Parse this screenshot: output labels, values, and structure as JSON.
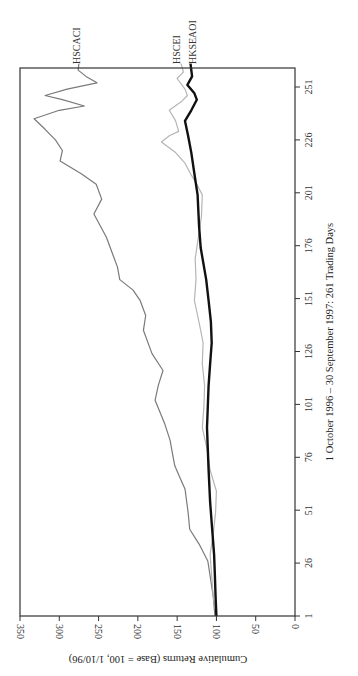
{
  "chart_data": {
    "type": "line",
    "orientation": "rotated-90-clockwise",
    "title": "",
    "xlabel": "1 October 1996 – 30 September 1997: 261 Trading Days",
    "ylabel": "Cumulative Returns (Base = 100, 1/10/96)",
    "x_ticks": [
      1,
      26,
      51,
      76,
      101,
      126,
      151,
      176,
      201,
      226,
      251
    ],
    "y_ticks": [
      0,
      50,
      100,
      150,
      200,
      250,
      300,
      350
    ],
    "xlim": [
      1,
      262
    ],
    "ylim": [
      0,
      350
    ],
    "grid": false,
    "legend": "direct labels at series ends",
    "series": [
      {
        "name": "HSCACI",
        "color": "#7a7a7a",
        "width": 1.2,
        "points": [
          [
            1,
            102
          ],
          [
            10,
            104
          ],
          [
            20,
            108
          ],
          [
            27,
            111
          ],
          [
            35,
            122
          ],
          [
            42,
            134
          ],
          [
            50,
            136
          ],
          [
            61,
            140
          ],
          [
            66,
            146
          ],
          [
            72,
            153
          ],
          [
            78,
            156
          ],
          [
            84,
            159
          ],
          [
            92,
            166
          ],
          [
            103,
            178
          ],
          [
            110,
            174
          ],
          [
            117,
            168
          ],
          [
            125,
            182
          ],
          [
            136,
            193
          ],
          [
            143,
            190
          ],
          [
            150,
            197
          ],
          [
            155,
            206
          ],
          [
            160,
            223
          ],
          [
            166,
            226
          ],
          [
            172,
            232
          ],
          [
            180,
            240
          ],
          [
            191,
            256
          ],
          [
            198,
            246
          ],
          [
            205,
            253
          ],
          [
            210,
            272
          ],
          [
            216,
            299
          ],
          [
            221,
            296
          ],
          [
            226,
            305
          ],
          [
            231,
            318
          ],
          [
            236,
            332
          ],
          [
            240,
            300
          ],
          [
            242,
            268
          ],
          [
            245,
            296
          ],
          [
            247,
            318
          ],
          [
            250,
            290
          ],
          [
            253,
            252
          ],
          [
            256,
            266
          ],
          [
            259,
            276
          ],
          [
            262,
            275
          ]
        ]
      },
      {
        "name": "HSCEI",
        "color": "#b5b5b5",
        "width": 1.2,
        "points": [
          [
            1,
            100
          ],
          [
            10,
            104
          ],
          [
            20,
            106
          ],
          [
            30,
            108
          ],
          [
            40,
            104
          ],
          [
            50,
            101
          ],
          [
            60,
            100
          ],
          [
            70,
            108
          ],
          [
            80,
            112
          ],
          [
            90,
            118
          ],
          [
            100,
            116
          ],
          [
            110,
            115
          ],
          [
            120,
            118
          ],
          [
            130,
            117
          ],
          [
            136,
            120
          ],
          [
            143,
            124
          ],
          [
            150,
            128
          ],
          [
            160,
            126
          ],
          [
            170,
            127
          ],
          [
            175,
            125
          ],
          [
            180,
            123
          ],
          [
            190,
            119
          ],
          [
            200,
            118
          ],
          [
            205,
            125
          ],
          [
            210,
            133
          ],
          [
            215,
            140
          ],
          [
            220,
            152
          ],
          [
            225,
            170
          ],
          [
            228,
            160
          ],
          [
            230,
            148
          ],
          [
            235,
            152
          ],
          [
            240,
            160
          ],
          [
            244,
            145
          ],
          [
            247,
            137
          ],
          [
            250,
            140
          ],
          [
            255,
            150
          ],
          [
            258,
            142
          ],
          [
            262,
            145
          ]
        ]
      },
      {
        "name": "HKSEAOI",
        "color": "#111111",
        "width": 2.4,
        "points": [
          [
            1,
            100
          ],
          [
            10,
            101
          ],
          [
            20,
            102
          ],
          [
            30,
            103
          ],
          [
            40,
            105
          ],
          [
            55,
            108
          ],
          [
            70,
            110
          ],
          [
            80,
            111
          ],
          [
            90,
            112
          ],
          [
            100,
            111
          ],
          [
            110,
            110
          ],
          [
            120,
            108
          ],
          [
            130,
            106
          ],
          [
            140,
            107
          ],
          [
            150,
            110
          ],
          [
            160,
            113
          ],
          [
            175,
            120
          ],
          [
            185,
            122
          ],
          [
            200,
            124
          ],
          [
            210,
            128
          ],
          [
            220,
            132
          ],
          [
            228,
            136
          ],
          [
            235,
            140
          ],
          [
            240,
            132
          ],
          [
            245,
            125
          ],
          [
            248,
            128
          ],
          [
            252,
            137
          ],
          [
            256,
            131
          ],
          [
            262,
            133
          ]
        ]
      }
    ]
  }
}
